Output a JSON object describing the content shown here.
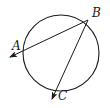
{
  "diagram": {
    "points": {
      "A": {
        "label": "A"
      },
      "B": {
        "label": "B"
      },
      "C": {
        "label": "C"
      }
    },
    "rays": [
      {
        "from": "B",
        "toward": "A",
        "arrow": true
      },
      {
        "from": "B",
        "toward": "C",
        "arrow": true
      }
    ],
    "stroke_color": "#1a1a1a"
  }
}
